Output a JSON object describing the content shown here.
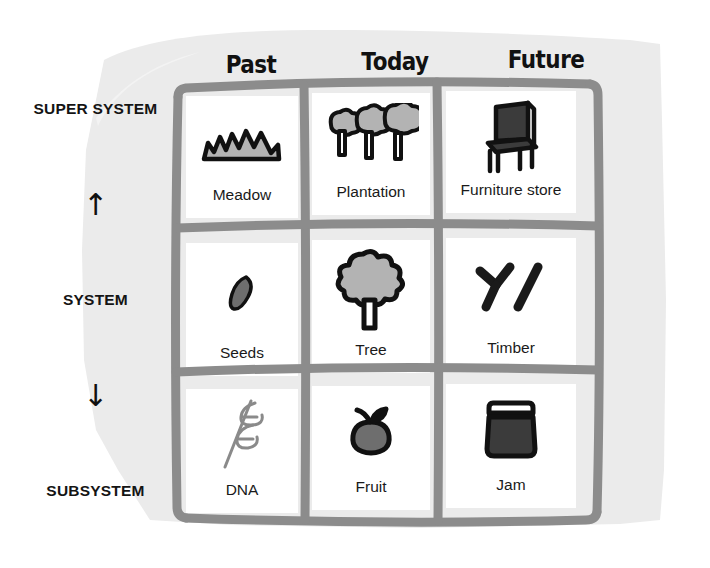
{
  "diagram": {
    "paper_color": "#ebebeb",
    "grid_stroke_color": "#8c8c8c",
    "ink_color": "#111111",
    "fill_gray": "#b3b3b3",
    "fill_dark": "#3b3b3b"
  },
  "columns": [
    {
      "id": "past",
      "label": "Past"
    },
    {
      "id": "today",
      "label": "Today"
    },
    {
      "id": "future",
      "label": "Future"
    }
  ],
  "rows": [
    {
      "id": "super-system",
      "label": "SUPER SYSTEM"
    },
    {
      "id": "system",
      "label": "SYSTEM"
    },
    {
      "id": "subsystem",
      "label": "SUBSYSTEM"
    }
  ],
  "axis": {
    "arrow_up": "↑",
    "arrow_down": "↓",
    "arrow_up_name": "up-arrow-icon",
    "arrow_down_name": "down-arrow-icon"
  },
  "cells": [
    [
      {
        "label": "Meadow",
        "icon": "meadow-icon"
      },
      {
        "label": "Plantation",
        "icon": "plantation-trees-icon"
      },
      {
        "label": "Furniture store",
        "icon": "chair-icon"
      }
    ],
    [
      {
        "label": "Seeds",
        "icon": "seed-icon"
      },
      {
        "label": "Tree",
        "icon": "tree-icon"
      },
      {
        "label": "Timber",
        "icon": "timber-logs-icon"
      }
    ],
    [
      {
        "label": "DNA",
        "icon": "dna-helix-icon"
      },
      {
        "label": "Fruit",
        "icon": "fruit-icon"
      },
      {
        "label": "Jam",
        "icon": "jam-jar-icon"
      }
    ]
  ]
}
